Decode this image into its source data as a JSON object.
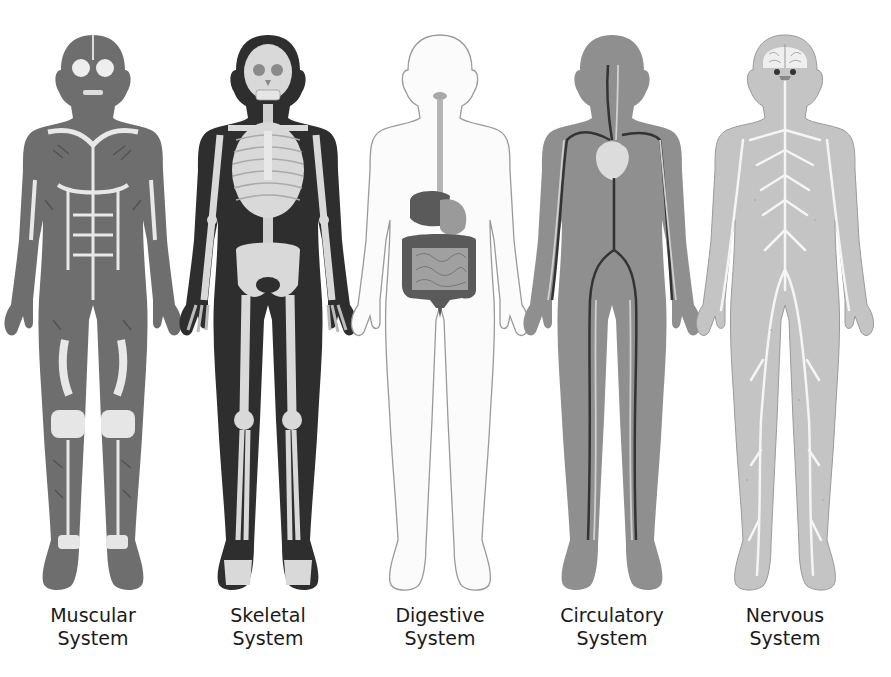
{
  "diagram": {
    "title": "",
    "colors": {
      "muscle": "#6e6e6e",
      "skeleton_body": "#2e2e2e",
      "bone": "#d9d9d9",
      "outline": "#9a9a9a",
      "digestive_dark": "#5a5a5a",
      "digestive_light": "#a8a8a8",
      "circulatory_body": "#8f8f8f",
      "vessel_dark": "#333333",
      "nervous_body": "#c4c4c4",
      "nerve": "#f5f5f5"
    },
    "figures": [
      {
        "id": "muscular",
        "label_line1": "Muscular",
        "label_line2": "System",
        "icon": "muscular-body-icon"
      },
      {
        "id": "skeletal",
        "label_line1": "Skeletal",
        "label_line2": "System",
        "icon": "skeletal-body-icon"
      },
      {
        "id": "digestive",
        "label_line1": "Digestive",
        "label_line2": "System",
        "icon": "digestive-body-icon"
      },
      {
        "id": "circulatory",
        "label_line1": "Circulatory",
        "label_line2": "System",
        "icon": "circulatory-body-icon"
      },
      {
        "id": "nervous",
        "label_line1": "Nervous",
        "label_line2": "System",
        "icon": "nervous-body-icon"
      }
    ]
  }
}
